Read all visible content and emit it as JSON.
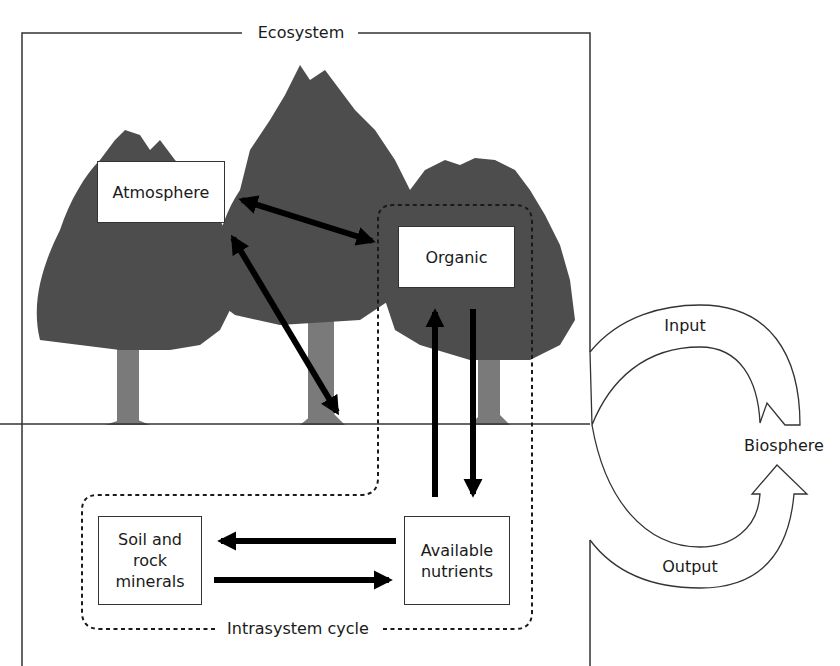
{
  "diagram": {
    "system_label": "Ecosystem",
    "intrasystem_label": "Intrasystem cycle",
    "external_label": "Biosphere",
    "flows": {
      "input_label": "Input",
      "output_label": "Output"
    },
    "nodes": {
      "atmosphere": "Atmosphere",
      "organic": "Organic",
      "soil_line1": "Soil and",
      "soil_line2": "rock",
      "soil_line3": "minerals",
      "nutrients_line1": "Available",
      "nutrients_line2": "nutrients"
    },
    "edges": [
      {
        "from": "Atmosphere",
        "to": "Organic",
        "direction": "bidirectional"
      },
      {
        "from": "Atmosphere",
        "to": "Ground (tree base)",
        "direction": "bidirectional"
      },
      {
        "from": "Available nutrients",
        "to": "Organic",
        "direction": "one-way"
      },
      {
        "from": "Organic",
        "to": "Available nutrients",
        "direction": "one-way"
      },
      {
        "from": "Available nutrients",
        "to": "Soil and rock minerals",
        "direction": "one-way"
      },
      {
        "from": "Soil and rock minerals",
        "to": "Available nutrients",
        "direction": "one-way"
      },
      {
        "from": "Biosphere",
        "to": "Ecosystem",
        "label": "Input"
      },
      {
        "from": "Ecosystem",
        "to": "Biosphere",
        "label": "Output"
      }
    ],
    "colors": {
      "tree_canopy": "#4d4d4d",
      "tree_trunk": "#7a7a7a",
      "lines": "#333333",
      "arrows": "#000000"
    }
  }
}
